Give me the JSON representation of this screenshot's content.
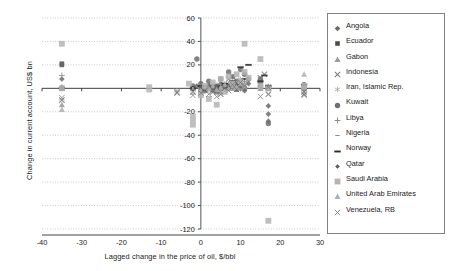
{
  "chart_data": {
    "type": "scatter",
    "title": "",
    "xlabel": "Lagged change in the price of oil, $/bbl",
    "ylabel": "Change in current account, US$ bn",
    "xlim": [
      -40,
      30
    ],
    "ylim": [
      -120,
      60
    ],
    "xticks": [
      "-40",
      "-30",
      "-20",
      "-10",
      "0",
      "10",
      "20",
      "30"
    ],
    "xtick_values": [
      -40,
      -30,
      -20,
      -10,
      0,
      10,
      20,
      30
    ],
    "yticks": [
      "60",
      "40",
      "20",
      "0",
      "-20",
      "-40",
      "-60",
      "-80",
      "-100",
      "-120"
    ],
    "ytick_values": [
      60,
      40,
      20,
      0,
      -20,
      -40,
      -60,
      -80,
      -100,
      -120
    ],
    "grid": "horizontal-dotted",
    "legend_position": "right",
    "series": [
      {
        "name": "Angola",
        "marker": "diamond",
        "color": "#6b6b6b",
        "points": [
          [
            -35,
            1
          ],
          [
            -35,
            8
          ],
          [
            -2,
            0
          ],
          [
            -1,
            2
          ],
          [
            1,
            -1
          ],
          [
            2,
            3
          ],
          [
            3,
            -2
          ],
          [
            4,
            1
          ],
          [
            5,
            4
          ],
          [
            6,
            -1
          ],
          [
            7,
            2
          ],
          [
            8,
            5
          ],
          [
            9,
            1
          ],
          [
            10,
            3
          ],
          [
            11,
            -2
          ],
          [
            12,
            4
          ],
          [
            15,
            1
          ],
          [
            17,
            -15
          ],
          [
            17,
            -22
          ],
          [
            17,
            -28
          ],
          [
            26,
            2
          ],
          [
            26,
            -1
          ]
        ]
      },
      {
        "name": "Ecuador",
        "marker": "square",
        "color": "#4d4d4d",
        "points": [
          [
            -35,
            21
          ],
          [
            -35,
            20
          ],
          [
            -35,
            0
          ],
          [
            -2,
            0
          ],
          [
            0,
            -1
          ],
          [
            1,
            1
          ],
          [
            2,
            0
          ],
          [
            3,
            -1
          ],
          [
            4,
            2
          ],
          [
            5,
            0
          ],
          [
            6,
            1
          ],
          [
            7,
            0
          ],
          [
            8,
            2
          ],
          [
            9,
            -1
          ],
          [
            10,
            1
          ],
          [
            11,
            0
          ],
          [
            15,
            1
          ],
          [
            17,
            0
          ],
          [
            26,
            0
          ]
        ]
      },
      {
        "name": "Gabon",
        "marker": "triangle",
        "color": "#9a9a9a",
        "points": [
          [
            -35,
            -14
          ],
          [
            -35,
            0
          ],
          [
            -2,
            0
          ],
          [
            0,
            -1
          ],
          [
            1,
            0
          ],
          [
            2,
            1
          ],
          [
            3,
            0
          ],
          [
            4,
            -1
          ],
          [
            5,
            1
          ],
          [
            6,
            0
          ],
          [
            7,
            2
          ],
          [
            8,
            0
          ],
          [
            9,
            1
          ],
          [
            10,
            0
          ],
          [
            11,
            1
          ],
          [
            15,
            0
          ],
          [
            17,
            0
          ],
          [
            26,
            0
          ]
        ]
      },
      {
        "name": "Indonesia",
        "marker": "x",
        "color": "#7d7d7d",
        "points": [
          [
            -35,
            -10
          ],
          [
            -6,
            -4
          ],
          [
            -2,
            -3
          ],
          [
            0,
            -2
          ],
          [
            1,
            -1
          ],
          [
            2,
            0
          ],
          [
            3,
            -3
          ],
          [
            4,
            -2
          ],
          [
            5,
            -5
          ],
          [
            6,
            2
          ],
          [
            7,
            8
          ],
          [
            8,
            10
          ],
          [
            9,
            4
          ],
          [
            10,
            6
          ],
          [
            11,
            3
          ],
          [
            15,
            9
          ],
          [
            16,
            12
          ],
          [
            17,
            -5
          ],
          [
            26,
            -5
          ],
          [
            26,
            -3
          ]
        ]
      },
      {
        "name": "Iran, Islamic Rep.",
        "marker": "asterisk",
        "color": "#a8a8a8",
        "points": [
          [
            -35,
            0
          ],
          [
            -6,
            -2
          ],
          [
            -2,
            -4
          ],
          [
            0,
            -1
          ],
          [
            1,
            2
          ],
          [
            2,
            -2
          ],
          [
            3,
            1
          ],
          [
            4,
            3
          ],
          [
            5,
            -1
          ],
          [
            6,
            4
          ],
          [
            7,
            2
          ],
          [
            8,
            6
          ],
          [
            9,
            3
          ],
          [
            10,
            8
          ],
          [
            11,
            5
          ],
          [
            15,
            4
          ],
          [
            17,
            2
          ],
          [
            26,
            1
          ]
        ]
      },
      {
        "name": "Kuwait",
        "marker": "circle",
        "color": "#707070",
        "points": [
          [
            -35,
            0
          ],
          [
            -1,
            25
          ],
          [
            -2,
            2
          ],
          [
            0,
            4
          ],
          [
            1,
            -2
          ],
          [
            2,
            6
          ],
          [
            3,
            1
          ],
          [
            4,
            -3
          ],
          [
            5,
            8
          ],
          [
            6,
            2
          ],
          [
            7,
            14
          ],
          [
            8,
            10
          ],
          [
            9,
            6
          ],
          [
            10,
            16
          ],
          [
            11,
            12
          ],
          [
            12,
            8
          ],
          [
            15,
            8
          ],
          [
            15,
            5
          ],
          [
            17,
            1
          ],
          [
            17,
            -30
          ],
          [
            26,
            3
          ]
        ]
      },
      {
        "name": "Libya",
        "marker": "plus",
        "color": "#8c8c8c",
        "points": [
          [
            -35,
            11
          ],
          [
            -2,
            0
          ],
          [
            0,
            1
          ],
          [
            1,
            -1
          ],
          [
            2,
            2
          ],
          [
            3,
            0
          ],
          [
            4,
            1
          ],
          [
            5,
            3
          ],
          [
            6,
            0
          ],
          [
            7,
            4
          ],
          [
            8,
            2
          ],
          [
            9,
            5
          ],
          [
            10,
            3
          ],
          [
            11,
            6
          ],
          [
            15,
            2
          ],
          [
            17,
            1
          ],
          [
            26,
            1
          ]
        ]
      },
      {
        "name": "Nigeria",
        "marker": "dash-small",
        "color": "#8c8c8c",
        "points": [
          [
            -35,
            0
          ],
          [
            -2,
            -1
          ],
          [
            0,
            0
          ],
          [
            1,
            1
          ],
          [
            2,
            -1
          ],
          [
            3,
            2
          ],
          [
            4,
            0
          ],
          [
            5,
            1
          ],
          [
            6,
            3
          ],
          [
            7,
            0
          ],
          [
            8,
            2
          ],
          [
            9,
            4
          ],
          [
            10,
            1
          ],
          [
            11,
            3
          ],
          [
            15,
            1
          ],
          [
            17,
            0
          ],
          [
            26,
            0
          ]
        ]
      },
      {
        "name": "Norway",
        "marker": "dash-bold",
        "color": "#2b2b2b",
        "points": [
          [
            -35,
            0
          ],
          [
            -2,
            0
          ],
          [
            0,
            2
          ],
          [
            1,
            -1
          ],
          [
            2,
            1
          ],
          [
            3,
            3
          ],
          [
            4,
            0
          ],
          [
            5,
            2
          ],
          [
            6,
            4
          ],
          [
            7,
            1
          ],
          [
            8,
            6
          ],
          [
            9,
            3
          ],
          [
            10,
            18
          ],
          [
            11,
            8
          ],
          [
            12,
            20
          ],
          [
            15,
            6
          ],
          [
            16,
            11
          ],
          [
            17,
            2
          ],
          [
            26,
            3
          ]
        ]
      },
      {
        "name": "Qatar",
        "marker": "diamond-small",
        "color": "#5c5c5c",
        "points": [
          [
            -35,
            0
          ],
          [
            -2,
            0
          ],
          [
            0,
            1
          ],
          [
            1,
            0
          ],
          [
            2,
            1
          ],
          [
            3,
            0
          ],
          [
            4,
            2
          ],
          [
            5,
            1
          ],
          [
            6,
            0
          ],
          [
            7,
            2
          ],
          [
            8,
            1
          ],
          [
            9,
            3
          ],
          [
            10,
            2
          ],
          [
            11,
            1
          ],
          [
            15,
            1
          ],
          [
            17,
            0
          ],
          [
            26,
            1
          ]
        ]
      },
      {
        "name": "Saudi Arabia",
        "marker": "square-light",
        "color": "#b5b5b5",
        "points": [
          [
            -35,
            38
          ],
          [
            -35,
            0
          ],
          [
            -13,
            -1
          ],
          [
            -13,
            1
          ],
          [
            -2,
            -24
          ],
          [
            -2,
            -31
          ],
          [
            -2,
            -28
          ],
          [
            -3,
            4
          ],
          [
            0,
            -6
          ],
          [
            1,
            2
          ],
          [
            2,
            -9
          ],
          [
            3,
            5
          ],
          [
            4,
            -14
          ],
          [
            5,
            8
          ],
          [
            6,
            -3
          ],
          [
            7,
            10
          ],
          [
            8,
            4
          ],
          [
            9,
            12
          ],
          [
            10,
            6
          ],
          [
            11,
            38
          ],
          [
            11,
            14
          ],
          [
            12,
            9
          ],
          [
            15,
            25
          ],
          [
            15,
            2
          ],
          [
            17,
            -113
          ],
          [
            17,
            0
          ],
          [
            26,
            2
          ]
        ]
      },
      {
        "name": "United Arab Emirates",
        "marker": "triangle-light",
        "color": "#b0b0b0",
        "points": [
          [
            -35,
            -18
          ],
          [
            -2,
            0
          ],
          [
            0,
            -2
          ],
          [
            1,
            1
          ],
          [
            2,
            0
          ],
          [
            3,
            2
          ],
          [
            4,
            -1
          ],
          [
            5,
            1
          ],
          [
            6,
            3
          ],
          [
            7,
            0
          ],
          [
            8,
            2
          ],
          [
            9,
            1
          ],
          [
            10,
            4
          ],
          [
            11,
            2
          ],
          [
            15,
            1
          ],
          [
            17,
            0
          ],
          [
            26,
            12
          ],
          [
            26,
            1
          ]
        ]
      },
      {
        "name": "Venezuela, RB",
        "marker": "x-thin",
        "color": "#6e6e6e",
        "points": [
          [
            -35,
            -8
          ],
          [
            -6,
            -3
          ],
          [
            -2,
            -6
          ],
          [
            0,
            -4
          ],
          [
            1,
            -2
          ],
          [
            2,
            -5
          ],
          [
            3,
            -1
          ],
          [
            4,
            -7
          ],
          [
            5,
            -3
          ],
          [
            6,
            0
          ],
          [
            7,
            -2
          ],
          [
            8,
            3
          ],
          [
            9,
            -1
          ],
          [
            10,
            5
          ],
          [
            11,
            2
          ],
          [
            15,
            -7
          ],
          [
            17,
            1
          ],
          [
            26,
            -6
          ]
        ]
      }
    ]
  },
  "legend": {
    "items": [
      {
        "label": "Angola",
        "marker": "diamond",
        "color": "#6b6b6b"
      },
      {
        "label": "Ecuador",
        "marker": "square",
        "color": "#4d4d4d"
      },
      {
        "label": "Gabon",
        "marker": "triangle",
        "color": "#9a9a9a"
      },
      {
        "label": "Indonesia",
        "marker": "x",
        "color": "#7d7d7d"
      },
      {
        "label": "Iran, Islamic Rep.",
        "marker": "asterisk",
        "color": "#a8a8a8"
      },
      {
        "label": "Kuwait",
        "marker": "circle",
        "color": "#707070"
      },
      {
        "label": "Libya",
        "marker": "plus",
        "color": "#8c8c8c"
      },
      {
        "label": "Nigeria",
        "marker": "dash-small",
        "color": "#8c8c8c"
      },
      {
        "label": "Norway",
        "marker": "dash-bold",
        "color": "#2b2b2b"
      },
      {
        "label": "Qatar",
        "marker": "diamond-small",
        "color": "#5c5c5c"
      },
      {
        "label": "Saudi Arabia",
        "marker": "square-light",
        "color": "#b5b5b5"
      },
      {
        "label": "United Arab Emirates",
        "marker": "triangle-light",
        "color": "#b0b0b0"
      },
      {
        "label": "Venezuela, RB",
        "marker": "x-thin",
        "color": "#6e6e6e"
      }
    ]
  },
  "colors": {
    "axis": "#555555",
    "grid": "#bdbdbd",
    "legend_border": "#808080",
    "text": "#1a1a1a",
    "background": "#ffffff"
  }
}
